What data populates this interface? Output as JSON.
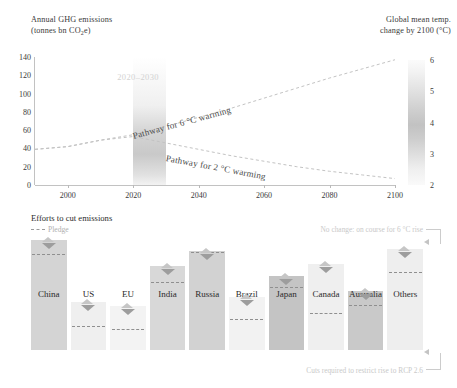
{
  "top": {
    "left_axis_title_line1": "Annual GHG emissions",
    "left_axis_title_line2_pre": "(tonnes bn CO",
    "left_axis_title_line2_sub": "2",
    "left_axis_title_line2_post": "e)",
    "right_axis_title_line1": "Global mean temp.",
    "right_axis_title_line2": "change by 2100 (°C)",
    "band_label": "2020–2030",
    "pathway_6c_label": "Pathway for 6 °C warming",
    "pathway_2c_label": "Pathway for 2 °C warming"
  },
  "bottom": {
    "title": "Efforts to cut emissions",
    "pledge_legend_label": "Pledge",
    "annotation_top": "No change: on course for 6 °C rise",
    "annotation_bottom": "Cuts required to restrict rise to RCP 2.6"
  },
  "chart_data": [
    {
      "type": "line",
      "title": "Annual GHG emissions",
      "xlabel": "",
      "ylabel": "Annual GHG emissions (tonnes bn CO2e)",
      "xlim": [
        1990,
        2100
      ],
      "ylim": [
        0,
        140
      ],
      "yticks": [
        0,
        20,
        40,
        60,
        80,
        100,
        120,
        140
      ],
      "xticks": [
        2000,
        2020,
        2040,
        2060,
        2080,
        2100
      ],
      "grid": false,
      "legend": "none",
      "secondary_axis": {
        "label": "Global mean temp. change by 2100 (°C)",
        "ticks": [
          2,
          3,
          4,
          5,
          6
        ],
        "lim": [
          2,
          6
        ]
      },
      "shaded_band": {
        "label": "2020–2030",
        "x_start": 2020,
        "x_end": 2030
      },
      "series": [
        {
          "name": "Pathway for 6 °C warming",
          "x": [
            1990,
            2000,
            2010,
            2020,
            2030,
            2040,
            2050,
            2060,
            2070,
            2080,
            2090,
            2100
          ],
          "values": [
            39,
            42,
            49,
            55,
            64,
            74,
            84,
            95,
            106,
            117,
            127,
            137
          ]
        },
        {
          "name": "Pathway for 2 °C warming",
          "x": [
            1990,
            2000,
            2010,
            2020,
            2030,
            2040,
            2050,
            2060,
            2070,
            2080,
            2090,
            2100
          ],
          "values": [
            39,
            42,
            49,
            53,
            46,
            39,
            32,
            26,
            20,
            15,
            11,
            7
          ]
        }
      ]
    },
    {
      "type": "bar",
      "title": "Efforts to cut emissions",
      "xlabel": "",
      "ylabel": "",
      "grid": false,
      "categories": [
        "China",
        "US",
        "EU",
        "India",
        "Russia",
        "Brazil",
        "Japan",
        "Canada",
        "Australia",
        "Others"
      ],
      "values": [
        100,
        44,
        40,
        76,
        90,
        48,
        67,
        78,
        54,
        92
      ],
      "pledge_values": [
        86,
        21,
        18,
        61,
        88,
        27,
        56,
        33,
        40,
        70
      ],
      "bar_shades": [
        "#d4d4d4",
        "#efefef",
        "#f3f3f3",
        "#d8d8d8",
        "#d2d2d2",
        "#f2f2f2",
        "#c4c4c4",
        "#efefef",
        "#c9c9c9",
        "#eeeeee"
      ]
    }
  ]
}
